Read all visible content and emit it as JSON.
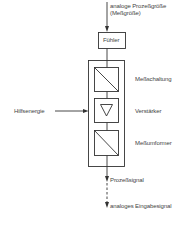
{
  "diagram": {
    "input": {
      "label_line1": "analoge Prozeßgröße",
      "label_line2": "(Meßgröße)"
    },
    "sensor": {
      "label": "Fühler"
    },
    "blocks": [
      {
        "label": "Meßschaltung",
        "icon": "converter-diagonal-icon"
      },
      {
        "label": "Verstärker",
        "icon": "amplifier-triangle-icon"
      },
      {
        "label": "Meßumformer",
        "icon": "converter-diagonal-icon"
      }
    ],
    "aux_power": {
      "label": "Hilfsenergie"
    },
    "output": {
      "label": "Prozeßsignal"
    },
    "final_output": {
      "label": "analoges Eingabesignal"
    },
    "colors": {
      "line": "#333333",
      "background": "#ffffff"
    }
  }
}
